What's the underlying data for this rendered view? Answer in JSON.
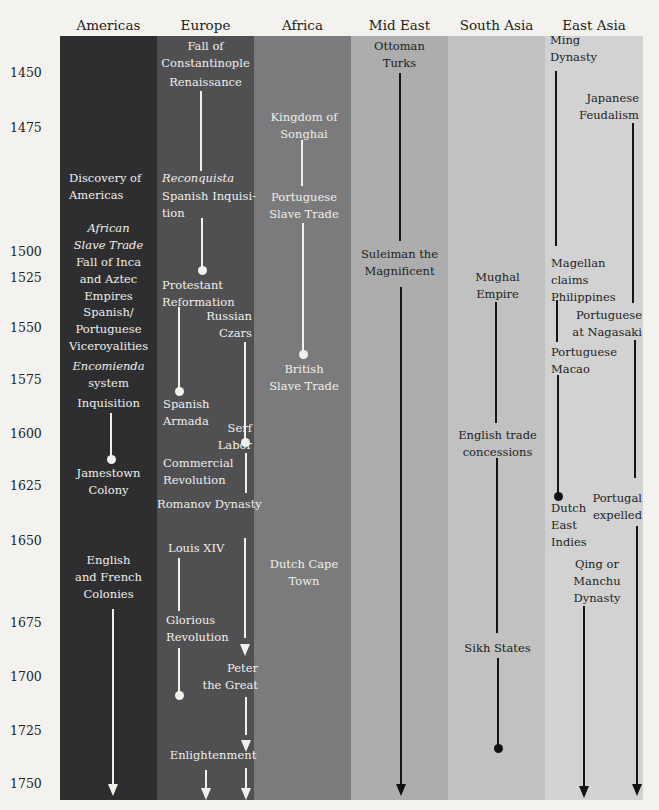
{
  "colors": {
    "background": "#f3f2ef",
    "americas": "#2e2e30",
    "europe": "#505053",
    "africa": "#7b7b7d",
    "mid_east": "#adadad",
    "south_asia": "#c1c1c1",
    "east_asia": "#d2d2d2"
  },
  "columns": [
    {
      "key": "americas",
      "label": "Americas"
    },
    {
      "key": "europe",
      "label": "Europe"
    },
    {
      "key": "africa",
      "label": "Africa"
    },
    {
      "key": "mid_east",
      "label": "Mid East"
    },
    {
      "key": "south_asia",
      "label": "South Asia"
    },
    {
      "key": "east_asia",
      "label": "East Asia"
    }
  ],
  "years": [
    "1450",
    "1475",
    "1500",
    "1525",
    "1550",
    "1575",
    "1600",
    "1625",
    "1650",
    "1675",
    "1700",
    "1725",
    "1750"
  ],
  "events": {
    "americas": {
      "discovery": "Discovery of\nAmericas",
      "african_slave_trade": "African\nSlave Trade",
      "fall_inca_aztec": "Fall of Inca\nand Aztec\nEmpires",
      "viceroyalities": "Spanish/\nPortuguese\nViceroyalities",
      "encomienda_italic": "Encomienda",
      "encomienda_rest": "system",
      "inquisition": "Inquisition",
      "jamestown": "Jamestown\nColony",
      "english_french": "English\nand French\nColonies"
    },
    "europe": {
      "fall_constantinople": "Fall of\nConstantinople",
      "renaissance": "Renaissance",
      "reconquista": "Reconquista",
      "spanish_inquisition": "Spanish Inquisi-\ntion",
      "protestant_reformation": "Protestant\nReformation",
      "russian_czars": "Russian\nCzars",
      "spanish_armada": "Spanish\nArmada",
      "serf_labor": "Serf\nLabor",
      "commercial_revolution": "Commercial\nRevolution",
      "romanov": "Romanov Dynasty",
      "louis_xiv": "Louis XIV",
      "glorious_revolution": "Glorious\nRevolution",
      "peter_great": "Peter\nthe Great",
      "enlightenment": "Enlightenment"
    },
    "africa": {
      "songhai": "Kingdom of\nSonghai",
      "portuguese_slave_trade": "Portuguese\nSlave Trade",
      "british_slave_trade": "British\nSlave Trade",
      "dutch_cape_town": "Dutch Cape\nTown"
    },
    "mid_east": {
      "ottoman": "Ottoman\nTurks",
      "suleiman": "Suleiman the\nMagnificent"
    },
    "south_asia": {
      "mughal": "Mughal\nEmpire",
      "english_trade": "English trade\nconcessions",
      "sikh": "Sikh States"
    },
    "east_asia": {
      "ming": "Ming\nDynasty",
      "japanese_feudalism": "Japanese\nFeudalism",
      "magellan": "Magellan\nclaims\nPhilippines",
      "portuguese_nagasaki": "Portuguese\nat Nagasaki",
      "portuguese_macao": "Portuguese\nMacao",
      "dutch_east_indies": "Dutch\nEast\nIndies",
      "portugal_expelled": "Portugal\nexpelled",
      "qing": "Qing or\nManchu\nDynasty"
    }
  }
}
